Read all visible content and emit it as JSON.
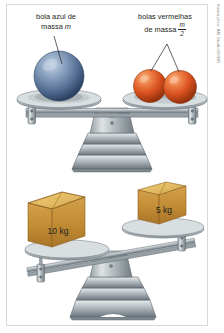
{
  "figure": {
    "credit": "Ilustrações: AM Studio/ID/BR",
    "background_color": "#ffffff",
    "border_color": "#d8d8d8"
  },
  "labels": {
    "blue": {
      "line1": "bola azul de",
      "line2": "massa ",
      "symbol": "m"
    },
    "red": {
      "line1": "bolas vermelhas",
      "line2": "de massa ",
      "numerator": "m",
      "denominator": "2"
    }
  },
  "scales": [
    {
      "name": "top-balance",
      "state": "balanced",
      "left_pan": {
        "object": "blue-ball",
        "count": 1,
        "mass_label": "m",
        "color": "#5b7ba6"
      },
      "right_pan": {
        "object": "red-balls",
        "count": 2,
        "mass_label": "m/2",
        "color": "#d9511f"
      }
    },
    {
      "name": "bottom-balance",
      "state": "tilted-left",
      "left_pan": {
        "object": "box",
        "mass_label": "10 kg",
        "color": "#c79137"
      },
      "right_pan": {
        "object": "box",
        "mass_label": "5 kg",
        "color": "#c79137"
      }
    }
  ],
  "box_labels": {
    "left": "10 kg",
    "right": "5 kg"
  },
  "colors": {
    "blue_ball": "#4f6e99",
    "blue_ball_light": "#a8bcd4",
    "blue_ball_dark": "#2d4465",
    "red_ball": "#d9511f",
    "red_ball_light": "#f08a52",
    "red_ball_dark": "#9d3510",
    "box_face": "#c08b33",
    "box_top": "#e3bb5f",
    "box_side": "#8f6320",
    "metal_light": "#e4e7e9",
    "metal_mid": "#a9b1b6",
    "metal_dark": "#6f797f",
    "text": "#231f20"
  }
}
